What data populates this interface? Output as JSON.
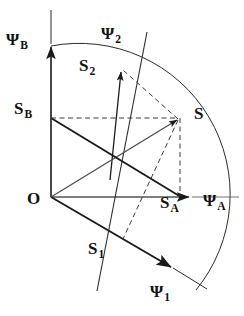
{
  "figure": {
    "kind": "vector-diagram",
    "background": "#ffffff",
    "stroke": "#1a1a1a",
    "origin": {
      "x": 51,
      "y": 197
    },
    "arc_radius": 151
  },
  "labels": {
    "origin": {
      "text": "O",
      "x": 27,
      "y": 198
    },
    "psi_b": {
      "base": "Ψ",
      "sub": "B",
      "x": 6,
      "y": 31
    },
    "psi_a": {
      "base": "Ψ",
      "sub": "A",
      "x": 203,
      "y": 198
    },
    "psi_1": {
      "base": "Ψ",
      "sub": "1",
      "x": 150,
      "y": 284
    },
    "psi_2": {
      "base": "Ψ",
      "sub": "2",
      "x": 101,
      "y": 25
    },
    "s_point": {
      "text": "S",
      "x": 194,
      "y": 105
    },
    "s_a": {
      "base": "S",
      "sub": "A",
      "x": 160,
      "y": 198
    },
    "s_b": {
      "base": "S",
      "sub": "B",
      "x": 14,
      "y": 100
    },
    "s_1": {
      "base": "S",
      "sub": "1",
      "x": 88,
      "y": 240
    },
    "s_2": {
      "base": "S",
      "sub": "2",
      "x": 79,
      "y": 57
    }
  },
  "geometry": {
    "axis_b": {
      "name": "vertical-axis-psi-b",
      "x1": 51,
      "y1": 197,
      "x2": 51,
      "y2": 44
    },
    "axis_b_tail": {
      "x1": 51,
      "y1": 44,
      "x2": 51,
      "y2": 10
    },
    "axis_a": {
      "name": "horizontal-axis-psi-a",
      "x1": 51,
      "y1": 197,
      "x2": 192,
      "y2": 197
    },
    "axis_a_tail": {
      "x1": 192,
      "y1": 197,
      "x2": 239,
      "y2": 197
    },
    "axis_1": {
      "name": "axis-psi-1",
      "x1": 51,
      "y1": 197,
      "x2": 173,
      "y2": 268
    },
    "axis_1_tail": {
      "x1": 173,
      "y1": 268,
      "x2": 206,
      "y2": 288
    },
    "axis_2": {
      "name": "axis-psi-2",
      "x1": 97,
      "y1": 290,
      "x2": 122,
      "y2": 69
    },
    "axis_2_tail": {
      "x1": 122,
      "y1": 69,
      "x2": 147,
      "y2": 32
    },
    "vector_s": {
      "name": "vector-s",
      "x1": 51,
      "y1": 197,
      "x2": 180,
      "y2": 118
    },
    "vector_sb_line": {
      "name": "component-sb-line",
      "x1": 51,
      "y1": 118,
      "x2": 180,
      "y2": 197
    },
    "dash_sb": {
      "name": "dashed-sb-projection",
      "x1": 51,
      "y1": 118,
      "x2": 180,
      "y2": 118
    },
    "dash_sa": {
      "name": "dashed-sa-projection",
      "x1": 180,
      "y1": 118,
      "x2": 180,
      "y2": 197
    },
    "dash_s2": {
      "name": "dashed-s2-projection",
      "x1": 180,
      "y1": 118,
      "x2": 122,
      "y2": 69
    },
    "dash_s1": {
      "name": "dashed-s1-projection",
      "x1": 180,
      "y1": 118,
      "x2": 123,
      "y2": 238
    }
  }
}
